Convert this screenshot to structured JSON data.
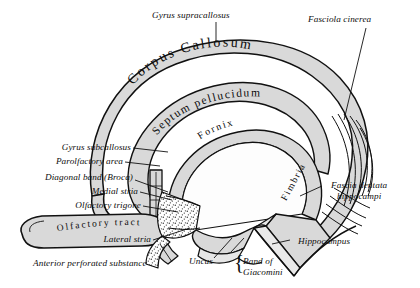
{
  "figure": {
    "background_color": "#ffffff",
    "ink_color": "#111111",
    "fill_gray": "#d9d9d9",
    "fill_light": "#ececec",
    "stipple_color": "#4a4a4a"
  },
  "inline_labels": [
    {
      "id": "corpus-callosum",
      "text": "Corpus  Callosum"
    },
    {
      "id": "septum-pellucidum",
      "text": "Septum pellucidum"
    },
    {
      "id": "fornix",
      "text": "Fornix"
    },
    {
      "id": "fimbria",
      "text": "Fimbria"
    },
    {
      "id": "olfactory-tract",
      "text": "Olfactory tract"
    }
  ],
  "callout_labels": [
    {
      "id": "gyrus-supracallosus",
      "text": "Gyrus supracallosus"
    },
    {
      "id": "fasciola-cinerea",
      "text": "Fasciola cinerea"
    },
    {
      "id": "gyrus-subcallosus",
      "text": "Gyrus subcallosus"
    },
    {
      "id": "parolfactory-area",
      "text": "Parolfactory area"
    },
    {
      "id": "diagonal-band-broca",
      "text": "Diagonal band (Broca)"
    },
    {
      "id": "medial-stria",
      "text": "Medial stria"
    },
    {
      "id": "olfactory-trigone",
      "text": "Olfactory trigone"
    },
    {
      "id": "lateral-stria",
      "text": "Lateral stria"
    },
    {
      "id": "anterior-perforated-substance",
      "text": "Anterior perforated substance"
    },
    {
      "id": "uncus",
      "text": "Uncus"
    },
    {
      "id": "band-of-giacomini-line1",
      "text": "Band of"
    },
    {
      "id": "band-of-giacomini-line2",
      "text": "Giacomini"
    },
    {
      "id": "fascia-dentata-line1",
      "text": "Fascia dentata"
    },
    {
      "id": "fascia-dentata-line2",
      "text": "hippocampi"
    },
    {
      "id": "hippocampus",
      "text": "Hippocampus"
    }
  ]
}
